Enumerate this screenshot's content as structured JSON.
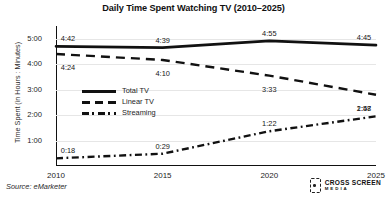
{
  "chart_data": {
    "type": "line",
    "title": "Daily Time Spent Watching TV (2010–2025)",
    "xlabel": "",
    "ylabel": "Time Spent (in Hours : Minutes)",
    "x": [
      "2010",
      "2015",
      "2020",
      "2025"
    ],
    "categories": [
      "2010",
      "2015",
      "2020",
      "2025"
    ],
    "ytick_labels": [
      "5:00",
      "4:00",
      "3:00",
      "2:00",
      "1:00"
    ],
    "ytick_values": [
      300,
      240,
      180,
      120,
      60
    ],
    "ylim": [
      0,
      330
    ],
    "grid": true,
    "legend_position": "inside-left",
    "series": [
      {
        "name": "Total TV",
        "style": "solid",
        "color": "#111111",
        "labels": [
          "4:42",
          "4:39",
          "4:55",
          "4:45"
        ],
        "values": [
          282,
          279,
          295,
          285
        ]
      },
      {
        "name": "Linear TV",
        "style": "dashed",
        "color": "#111111",
        "labels": [
          "4:24",
          "4:10",
          "3:33",
          "2:48"
        ],
        "values": [
          264,
          250,
          213,
          168
        ]
      },
      {
        "name": "Streaming",
        "style": "dash-dot",
        "color": "#111111",
        "labels": [
          "0:18",
          "0:29",
          "1:22",
          "1:57"
        ],
        "values": [
          18,
          29,
          82,
          117
        ]
      }
    ],
    "source": "Source: eMarketer"
  },
  "footer": {
    "source": "Source: eMarketer",
    "logo_line1": "CROSS SCREEN",
    "logo_line2": "MEDIA"
  }
}
